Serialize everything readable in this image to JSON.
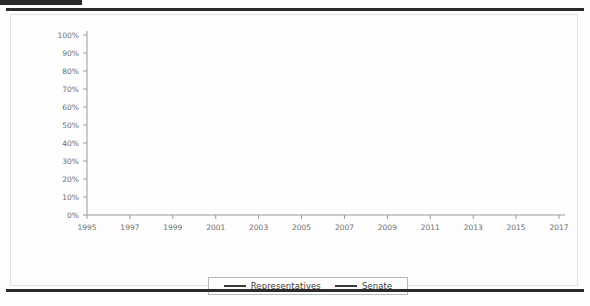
{
  "document": {
    "top_tab_color": "#2b2b2b",
    "rule_color": "#2b2b2b",
    "background_color": "#fdfdfd"
  },
  "legend": {
    "position": "bottom-center",
    "entries": [
      {
        "label": "Representatives",
        "color": "#3a3a3a"
      },
      {
        "label": "Senate",
        "color": "#3a3a3a"
      }
    ]
  },
  "chart_data": {
    "type": "line",
    "title": "",
    "subtitle": "",
    "xlabel": "",
    "ylabel": "",
    "grid": false,
    "legend_position": "bottom",
    "x": [
      "1995",
      "1997",
      "1999",
      "2001",
      "2003",
      "2005",
      "2007",
      "2009",
      "2011",
      "2013",
      "2015",
      "2017"
    ],
    "categories": [
      "1995",
      "1997",
      "1999",
      "2001",
      "2003",
      "2005",
      "2007",
      "2009",
      "2011",
      "2013",
      "2015",
      "2017"
    ],
    "xtick_labels": [
      "1995",
      "1997",
      "1999",
      "2001",
      "2003",
      "2005",
      "2007",
      "2009",
      "2011",
      "2013",
      "2015",
      "2017"
    ],
    "ytick_labels": [
      "0%",
      "10%",
      "20%",
      "30%",
      "40%",
      "50%",
      "60%",
      "70%",
      "80%",
      "90%",
      "100%"
    ],
    "ytick_values": [
      0,
      10,
      20,
      30,
      40,
      50,
      60,
      70,
      80,
      90,
      100
    ],
    "ylim": [
      0,
      100
    ],
    "yunit": "%",
    "series": [
      {
        "name": "Representatives",
        "color": "#3a3a3a",
        "values": [
          84,
          83,
          93,
          93,
          76,
          88,
          84,
          86,
          92,
          92,
          82,
          87
        ]
      },
      {
        "name": "Senate",
        "color": "#3a3a3a",
        "values": [
          81,
          81,
          93,
          96,
          76,
          100,
          84,
          81,
          77,
          72,
          72,
          86
        ]
      }
    ]
  }
}
